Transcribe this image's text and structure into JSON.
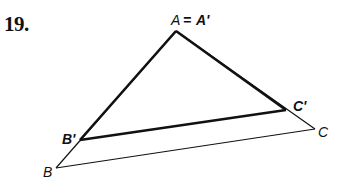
{
  "problem": {
    "number": "19."
  },
  "diagram": {
    "labels": {
      "A": "A",
      "equals": "=",
      "A_prime": "A'",
      "B": "B",
      "B_prime": "B'",
      "C": "C",
      "C_prime": "C'"
    },
    "points": {
      "A": [
        176,
        31
      ],
      "B": [
        56,
        168
      ],
      "C": [
        315,
        129
      ],
      "B_prime": [
        80,
        140
      ],
      "C_prime": [
        286,
        110
      ]
    },
    "colors": {
      "stroke": "#111111"
    }
  }
}
